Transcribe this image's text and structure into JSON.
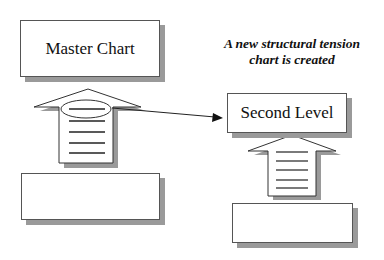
{
  "diagram": {
    "caption": {
      "line1": "A new structural tension",
      "line2": "chart is created"
    },
    "master_chart": {
      "label": "Master Chart"
    },
    "second_level": {
      "label": "Second Level"
    },
    "master_bottom_box": {
      "label": ""
    },
    "second_bottom_box": {
      "label": ""
    },
    "icons": {
      "master_arrow": "up-arrow-document-icon",
      "second_arrow": "up-arrow-document-icon",
      "connector": "right-arrow-connector-icon"
    },
    "colors": {
      "stroke": "#333333",
      "shadow": "#9a9a9a",
      "background": "#ffffff"
    }
  }
}
